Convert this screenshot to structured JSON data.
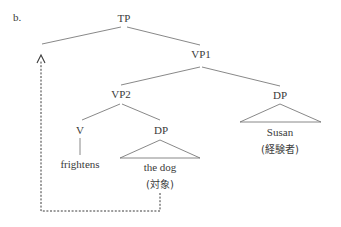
{
  "figure": {
    "label": "b."
  },
  "tree": {
    "root": "TP",
    "nodes": {
      "tp": "TP",
      "vp1": "VP1",
      "vp2": "VP2",
      "v": "V",
      "dp_object": "DP",
      "dp_subject": "DP"
    },
    "leaves": {
      "verb": "frightens",
      "object": "the dog",
      "object_role": "(対象)",
      "subject": "Susan",
      "subject_role": "(経験者)"
    },
    "movement": {
      "from": "the dog",
      "to": "TP specifier",
      "style": "dashed arrow"
    }
  }
}
